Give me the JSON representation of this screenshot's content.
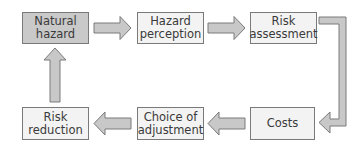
{
  "diagram": {
    "type": "flow-cycle",
    "colors": {
      "box_fill": "#f3f3f3",
      "box_fill_highlight": "#c9c9c9",
      "box_border": "#7a7a7a",
      "arrow_fill": "#c8c8c8",
      "arrow_stroke": "#7a7a7a",
      "text": "#3a3a3a"
    },
    "nodes": [
      {
        "id": "natural-hazard",
        "label": "Natural\nhazard",
        "highlighted": true
      },
      {
        "id": "hazard-perception",
        "label": "Hazard\nperception",
        "highlighted": false
      },
      {
        "id": "risk-assessment",
        "label": "Risk\nassessment",
        "highlighted": false
      },
      {
        "id": "costs",
        "label": "Costs",
        "highlighted": false
      },
      {
        "id": "choice-of-adjustment",
        "label": "Choice of\nadjustment",
        "highlighted": false
      },
      {
        "id": "risk-reduction",
        "label": "Risk\nreduction",
        "highlighted": false
      }
    ],
    "edges": [
      {
        "from": "natural-hazard",
        "to": "hazard-perception"
      },
      {
        "from": "hazard-perception",
        "to": "risk-assessment"
      },
      {
        "from": "risk-assessment",
        "to": "costs"
      },
      {
        "from": "costs",
        "to": "choice-of-adjustment"
      },
      {
        "from": "choice-of-adjustment",
        "to": "risk-reduction"
      },
      {
        "from": "risk-reduction",
        "to": "natural-hazard"
      }
    ]
  }
}
